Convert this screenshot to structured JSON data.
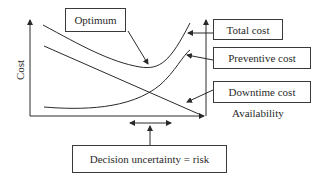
{
  "diagram": {
    "type": "cost-availability-tradeoff",
    "axes": {
      "y_label": "Cost",
      "x_label": "Availability"
    },
    "labels": {
      "optimum": "Optimum",
      "total_cost": "Total cost",
      "preventive_cost": "Preventive cost",
      "downtime_cost": "Downtime cost",
      "decision": "Decision uncertainty = risk"
    },
    "curves": [
      {
        "name": "Total cost",
        "shape": "U-shaped, minimum at optimum"
      },
      {
        "name": "Preventive cost",
        "shape": "increasing, steep at high availability"
      },
      {
        "name": "Downtime cost",
        "shape": "decreasing linear"
      }
    ],
    "colors": {
      "line": "#2a2a2a",
      "background": "#ffffff"
    }
  }
}
